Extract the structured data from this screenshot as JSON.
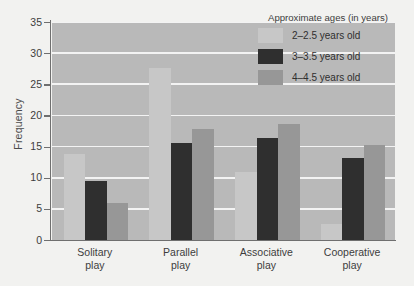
{
  "chart_data": {
    "type": "bar",
    "title": "",
    "xlabel": "",
    "ylabel": "Frequency",
    "ylim": [
      0,
      35
    ],
    "ytick_step": 5,
    "yticks": [
      0,
      5,
      10,
      15,
      20,
      25,
      30,
      35
    ],
    "grid": true,
    "legend_position": "top-right",
    "legend_title": "Approximate ages (in years)",
    "categories": [
      "Solitary play",
      "Parallel play",
      "Associative play",
      "Cooperative play"
    ],
    "categories_lines": [
      [
        "Solitary",
        "play"
      ],
      [
        "Parallel",
        "play"
      ],
      [
        "Associative",
        "play"
      ],
      [
        "Cooperative",
        "play"
      ]
    ],
    "series": [
      {
        "name": "2–2.5 years old",
        "color": "#c7c7c7",
        "values": [
          13.8,
          27.6,
          11.0,
          2.5
        ]
      },
      {
        "name": "3–3.5 years old",
        "color": "#2f2f2f",
        "values": [
          9.5,
          15.5,
          16.3,
          13.2
        ]
      },
      {
        "name": "4–4.5 years old",
        "color": "#979797",
        "values": [
          6.0,
          17.9,
          18.7,
          15.3
        ]
      }
    ]
  },
  "style": {
    "plot_background": "#b9b9b9",
    "page_background": "#f2f2f0",
    "gridline_color": "#f3f3f3",
    "axis_color": "#6f6f6f",
    "text_color": "#3d3d3d"
  }
}
